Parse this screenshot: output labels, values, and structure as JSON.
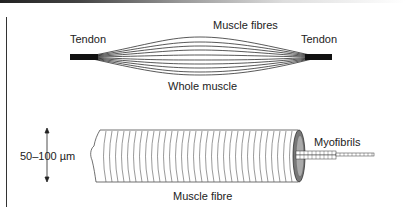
{
  "diagram": {
    "whole_muscle": {
      "label_tendon_left": "Tendon",
      "label_tendon_right": "Tendon",
      "label_fibres": "Muscle fibres",
      "label_caption": "Whole muscle"
    },
    "muscle_fibre": {
      "label_size": "50–100 µm",
      "label_myofibrils": "Myofibrils",
      "label_caption": "Muscle fibre"
    }
  }
}
